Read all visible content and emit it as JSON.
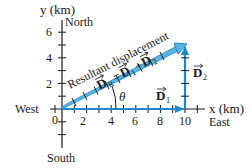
{
  "diagram": {
    "type": "vector-addition",
    "colors": {
      "axis": "#1a1a1a",
      "vector": "#1e88c8",
      "vector_fill": "#5bb3e0",
      "text": "#1a1a1a"
    },
    "axes": {
      "x": {
        "label": "x (km)",
        "ticks": [
          "2",
          "4",
          "6",
          "8",
          "10"
        ],
        "origin_label": "0"
      },
      "y": {
        "label": "y (km)",
        "ticks": [
          "2",
          "4",
          "6"
        ]
      }
    },
    "directions": {
      "north": "North",
      "south": "South",
      "east": "East",
      "west": "West"
    },
    "vectors": {
      "d1": {
        "label": "D",
        "subscript": "1",
        "dx_km": 10,
        "dy_km": 0
      },
      "d2": {
        "label": "D",
        "subscript": "2",
        "dx_km": 0,
        "dy_km": 5
      },
      "dr": {
        "label": "D",
        "subscript": "R",
        "dx_km": 10,
        "dy_km": 5
      }
    },
    "annotations": {
      "resultant_title": "Resultant displacement",
      "equation_eq": "=",
      "equation_plus": "+",
      "angle": "θ"
    }
  }
}
